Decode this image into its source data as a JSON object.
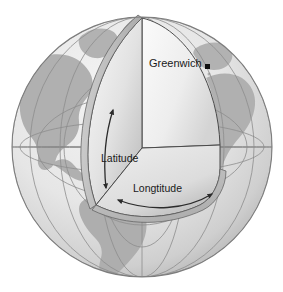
{
  "figure": {
    "type": "geographic-diagram"
  },
  "labels": {
    "greenwich": "Greenwich",
    "latitude": "Latitude",
    "longitude": "Longtitude"
  },
  "markers": {
    "greenwich_dot": "greenwich-point-marker"
  },
  "arrows": {
    "latitude_arrow": "double-headed-vertical-arc-arrow",
    "longitude_arrow": "double-headed-horizontal-arc-arrow"
  },
  "colors": {
    "background": "#ffffff",
    "ocean": "#e9e9e9",
    "land": "#b0b0b0",
    "graticule": "#8f8f8f",
    "outline": "#6e6e6e",
    "wedge_light": "#f2f2f2",
    "wedge_mid": "#d8d8d8",
    "wedge_dark": "#a8a8a8",
    "edge_line": "#4a4a4a",
    "text": "#1a1a1a"
  },
  "geometry": {
    "sphere_center_x": 142,
    "sphere_center_y": 147,
    "sphere_radius": 130,
    "wedge_vertex_x": 142,
    "wedge_vertex_y": 148,
    "north_pole_x": 142,
    "north_pole_y": 18
  },
  "continents": [
    "Greenland",
    "North America",
    "South America",
    "Europe",
    "Africa"
  ]
}
